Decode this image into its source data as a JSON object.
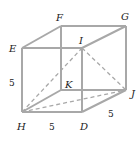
{
  "diagram": {
    "type": "cube",
    "vertices": {
      "E": "E",
      "F": "F",
      "G": "G",
      "I": "I",
      "H": "H",
      "K": "K",
      "D": "D",
      "J": "J"
    },
    "edge_lengths": {
      "HE": "5",
      "HD": "5",
      "DJ": "5"
    },
    "solid_edges": [
      "EF",
      "FG",
      "GI",
      "IE",
      "EH",
      "HD",
      "DI",
      "GJ",
      "JD",
      "FK",
      "KJ",
      "KH"
    ],
    "dashed_segments": [
      "HI",
      "HJ",
      "IJ"
    ],
    "colors": {
      "edge": "#a8a8a8",
      "text": "#222222"
    }
  }
}
